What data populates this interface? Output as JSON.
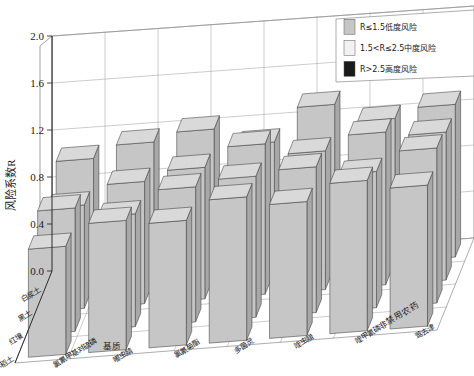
{
  "chart_data": {
    "type": "bar",
    "subtype": "3d-grouped-bar",
    "title": "",
    "xlabel": "非禁用农药",
    "ylabel": "风险系数R",
    "zlabel": "基质",
    "ylim": [
      0.0,
      2.0
    ],
    "yticks": [
      "0.0",
      "0.4",
      "0.8",
      "1.2",
      "1.6",
      "2.0"
    ],
    "ytick_values": [
      0.0,
      0.4,
      0.8,
      1.2,
      1.6,
      2.0
    ],
    "grid": true,
    "legend_position": "top-right",
    "categories": [
      "氯氰甲基对硫磷",
      "嘟虫腈",
      "氯氰菊酯",
      "多菌灵",
      "喹虫腊",
      "喹甲氰磷",
      "莺去津"
    ],
    "depth_categories": [
      "白浆土",
      "黑土",
      "红壤",
      "水稻土"
    ],
    "series": [
      {
        "name": "白浆土",
        "values": [
          1.08,
          1.18,
          1.25,
          1.1,
          1.38,
          1.22,
          1.3
        ]
      },
      {
        "name": "黑土",
        "values": [
          0.88,
          1.04,
          1.12,
          1.28,
          1.18,
          1.3,
          1.26
        ]
      },
      {
        "name": "红壤",
        "values": [
          1.05,
          0.96,
          1.15,
          1.2,
          1.24,
          1.16,
          1.32
        ]
      },
      {
        "name": "水稻土",
        "values": [
          0.92,
          1.1,
          1.06,
          1.22,
          1.14,
          1.28,
          1.2
        ]
      }
    ],
    "legend": [
      {
        "label": "R≤1.5低度风险",
        "color": "#c6c6c6",
        "key": "low-risk"
      },
      {
        "label": "1.5<R≤2.5中度风险",
        "color": "#f2f2f2",
        "key": "medium-risk"
      },
      {
        "label": "R>2.5高度风险",
        "color": "#1a1a1a",
        "key": "high-risk"
      }
    ]
  },
  "colors": {
    "bar_front": "#c6c6c6",
    "bar_side": "#a8a8a8",
    "bar_top": "#d9d9d9",
    "bar_edge": "#3c3c3c",
    "grid": "#9a9a9a",
    "panel": "#ffffff",
    "text": "#1a1a1a"
  }
}
